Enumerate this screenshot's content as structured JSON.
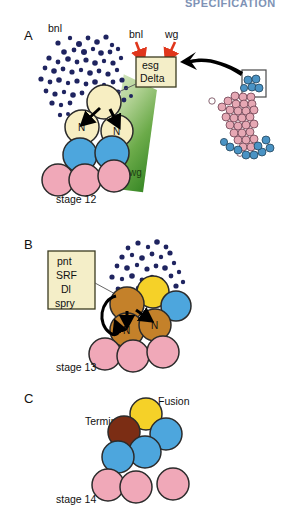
{
  "figure": {
    "title_partial": "SPECIFICATION",
    "panels": [
      {
        "letter": "A",
        "stage": "stage 12",
        "labels": {
          "ligand_cloud": "bnl",
          "arrow_left": "bnl",
          "arrow_right": "wg",
          "gradient_band": "wg"
        },
        "gene_box": {
          "lines": [
            "esg",
            "Delta"
          ]
        },
        "cells": [
          {
            "type": "tip",
            "label": ""
          },
          {
            "type": "tip",
            "label": "N"
          },
          {
            "type": "tip",
            "label": "N"
          },
          {
            "type": "blue",
            "label": ""
          },
          {
            "type": "blue",
            "label": ""
          },
          {
            "type": "pink",
            "label": ""
          },
          {
            "type": "pink",
            "label": ""
          },
          {
            "type": "pink",
            "label": ""
          }
        ]
      },
      {
        "letter": "B",
        "stage": "stage 13",
        "gene_box": {
          "lines": [
            "pnt",
            "SRF",
            "Dl",
            "spry"
          ]
        },
        "cells": [
          {
            "type": "brown",
            "label": ""
          },
          {
            "type": "brown",
            "label": "N"
          },
          {
            "type": "brown",
            "label": "N"
          },
          {
            "type": "yellow",
            "label": ""
          },
          {
            "type": "blue",
            "label": ""
          },
          {
            "type": "pink",
            "label": ""
          },
          {
            "type": "pink",
            "label": ""
          },
          {
            "type": "pink",
            "label": ""
          }
        ]
      },
      {
        "letter": "C",
        "stage": "stage 14",
        "labels": {
          "terminal": "Terminal",
          "fusion": "Fusion"
        },
        "cells": [
          {
            "type": "dark-brown",
            "label": ""
          },
          {
            "type": "yellow",
            "label": ""
          },
          {
            "type": "blue",
            "label": ""
          },
          {
            "type": "blue",
            "label": ""
          },
          {
            "type": "blue",
            "label": ""
          },
          {
            "type": "pink",
            "label": ""
          },
          {
            "type": "pink",
            "label": ""
          },
          {
            "type": "pink",
            "label": ""
          }
        ]
      }
    ],
    "colors": {
      "navy_dots": "#1f2460",
      "tip_cell": "#f7eec2",
      "blue_cell": "#4da6dd",
      "pink_cell": "#f0a8b8",
      "yellow_cell": "#f5d128",
      "brown_cell": "#c4812a",
      "dark_brown_cell": "#7b2d14",
      "red_arrow": "#e0361c",
      "wg_green_light": "#d6e6c2",
      "wg_green_dark": "#3d8b29",
      "box_fill": "#f4eec8",
      "title_blue": "#7e92b5"
    }
  }
}
